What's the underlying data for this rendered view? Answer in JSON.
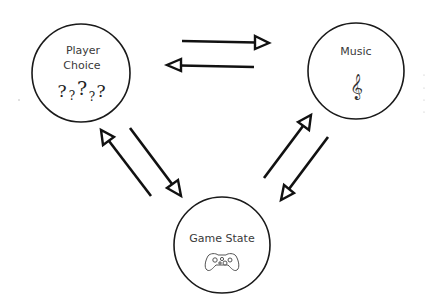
{
  "diagram": {
    "title": "",
    "nodes": [
      {
        "id": "player-choice",
        "label_lines": [
          "Player",
          "Choice"
        ],
        "icon": "question-marks-icon",
        "icon_text": [
          "?",
          "?",
          "?",
          "?",
          "?"
        ]
      },
      {
        "id": "music",
        "label_lines": [
          "Music"
        ],
        "icon": "treble-clef-icon",
        "icon_text": "𝄞"
      },
      {
        "id": "game-state",
        "label_lines": [
          "Game State"
        ],
        "icon": "game-controller-icon"
      }
    ],
    "edges": [
      {
        "from": "player-choice",
        "to": "music"
      },
      {
        "from": "music",
        "to": "player-choice"
      },
      {
        "from": "player-choice",
        "to": "game-state"
      },
      {
        "from": "game-state",
        "to": "player-choice"
      },
      {
        "from": "game-state",
        "to": "music"
      },
      {
        "from": "music",
        "to": "game-state"
      }
    ],
    "colors": {
      "stroke": "#111111",
      "text": "#3a3a3a",
      "background": "#ffffff"
    }
  }
}
